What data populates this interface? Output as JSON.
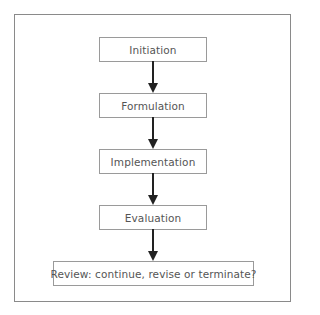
{
  "diagram": {
    "type": "flowchart",
    "direction": "top-to-bottom",
    "steps": [
      {
        "id": "initiation",
        "label": "Initiation"
      },
      {
        "id": "formulation",
        "label": "Formulation"
      },
      {
        "id": "implementation",
        "label": "Implementation"
      },
      {
        "id": "evaluation",
        "label": "Evaluation"
      },
      {
        "id": "review",
        "label": "Review: continue, revise or terminate?"
      }
    ],
    "edges": [
      {
        "from": "initiation",
        "to": "formulation"
      },
      {
        "from": "formulation",
        "to": "implementation"
      },
      {
        "from": "implementation",
        "to": "evaluation"
      },
      {
        "from": "evaluation",
        "to": "review"
      }
    ],
    "colors": {
      "border": "#9a9a9a",
      "text": "#555555",
      "arrow": "#222222",
      "frame": "#8a8a8a"
    }
  }
}
